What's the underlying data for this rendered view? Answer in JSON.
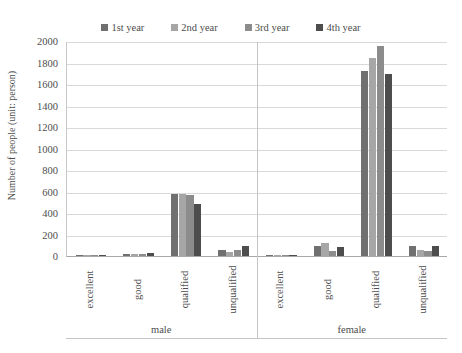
{
  "chart_data": {
    "type": "bar",
    "title": "",
    "xlabel": "",
    "ylabel": "Number of people (unit: person)",
    "ylim": [
      0,
      2000
    ],
    "ytick_step": 200,
    "yticks": [
      "2000",
      "1800",
      "1600",
      "1400",
      "1200",
      "1000",
      "800",
      "600",
      "400",
      "200",
      "0"
    ],
    "grid": true,
    "legend_position": "top-center",
    "groups": [
      "male",
      "female"
    ],
    "categories": [
      "excellent",
      "good",
      "qualified",
      "unqualified"
    ],
    "series": [
      {
        "name": "1st year",
        "color": "#707070",
        "values_male": [
          8,
          20,
          580,
          55
        ],
        "values_female": [
          6,
          90,
          1720,
          90
        ]
      },
      {
        "name": "2nd year",
        "color": "#a6a6a6",
        "values_male": [
          8,
          18,
          580,
          40
        ],
        "values_female": [
          6,
          125,
          1840,
          55
        ]
      },
      {
        "name": "3rd year",
        "color": "#8c8c8c",
        "values_male": [
          6,
          16,
          570,
          55
        ],
        "values_female": [
          5,
          50,
          1950,
          48
        ]
      },
      {
        "name": "4th year",
        "color": "#4d4d4d",
        "values_male": [
          9,
          30,
          480,
          90
        ],
        "values_female": [
          7,
          85,
          1690,
          95
        ]
      }
    ],
    "colors": {
      "series_1": "#707070",
      "series_2": "#a6a6a6",
      "series_3": "#8c8c8c",
      "series_4": "#4d4d4d",
      "gridline": "#d9d9d9",
      "axis": "#a8a8a8",
      "text": "#4d4d4d",
      "background": "#ffffff"
    }
  },
  "legend": {
    "items": [
      {
        "label": "1st year"
      },
      {
        "label": "2nd year"
      },
      {
        "label": "3rd year"
      },
      {
        "label": "4th year"
      }
    ]
  },
  "axis": {
    "y_title": "Number of people (unit: person)"
  }
}
